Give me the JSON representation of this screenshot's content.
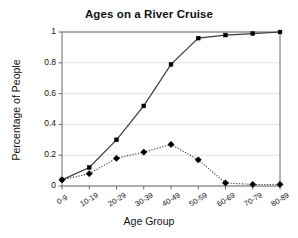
{
  "chart_data": {
    "type": "line",
    "title": "Ages on a River Cruise",
    "xlabel": "Age Group",
    "ylabel": "Percentage of People",
    "categories": [
      "0-9",
      "10-19",
      "20-29",
      "30-39",
      "40-49",
      "50-59",
      "60-69",
      "70-79",
      "80-89"
    ],
    "series": [
      {
        "name": "cumulative",
        "style": "solid",
        "marker": "square",
        "values": [
          0.04,
          0.12,
          0.3,
          0.52,
          0.79,
          0.96,
          0.98,
          0.99,
          1.0
        ]
      },
      {
        "name": "frequency",
        "style": "dotted",
        "marker": "diamond",
        "values": [
          0.04,
          0.08,
          0.18,
          0.22,
          0.27,
          0.17,
          0.02,
          0.01,
          0.01
        ]
      }
    ],
    "ylim": [
      0,
      1
    ],
    "yticks": [
      0,
      0.2,
      0.4,
      0.6,
      0.8,
      1
    ],
    "ytick_labels": [
      "0",
      "0.2",
      "0.4",
      "0.6",
      "0.8",
      "1"
    ],
    "grid": true,
    "grid_axis": "y",
    "legend": "none",
    "colors": {
      "line": "#3c3c3c",
      "marker": "#000000",
      "grid": "#d9d9d9",
      "axis": "#6b6b6b",
      "background": "#ffffff",
      "text": "#111111"
    }
  }
}
